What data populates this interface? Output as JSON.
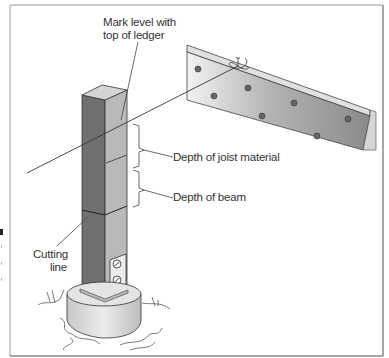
{
  "diagram": {
    "labels": {
      "mark_level": [
        "Mark level with",
        "top of ledger"
      ],
      "depth_joist": "Depth of joist material",
      "depth_beam": "Depth of beam",
      "cutting_line": [
        "Cutting",
        "line"
      ]
    },
    "components": [
      "post",
      "ledger",
      "string-line",
      "line-level-knot",
      "concrete-footing",
      "post-anchor",
      "bolts",
      "ground"
    ],
    "colors": {
      "post_dark": "#6e6e6e",
      "post_light": "#b9b9b9",
      "post_top": "#d2d2d2",
      "ledger_face": "#a8a8a8",
      "ledger_top": "#dcdcdc",
      "footing": "#d8d8d8",
      "line": "#3a3a3a",
      "frame": "#888888"
    }
  }
}
